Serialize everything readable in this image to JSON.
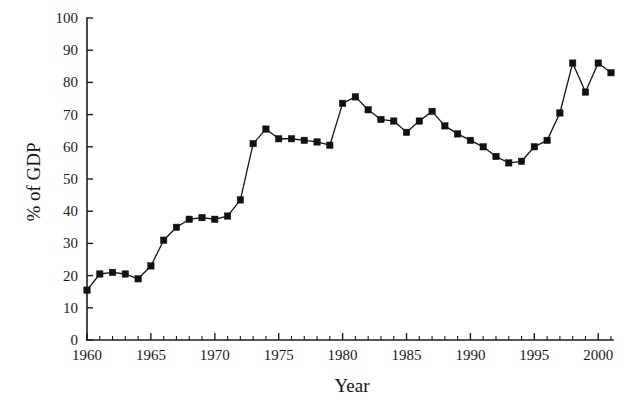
{
  "chart_data": {
    "type": "line",
    "title": "",
    "xlabel": "Year",
    "ylabel": "% of GDP",
    "xlim": [
      1959,
      2002
    ],
    "ylim": [
      0,
      100
    ],
    "grid": false,
    "legend": null,
    "x_major_ticks": [
      1960,
      1965,
      1970,
      1975,
      1980,
      1985,
      1990,
      1995,
      2000
    ],
    "x_tick_labels": [
      "1960",
      "1965",
      "1970",
      "1975",
      "1980",
      "1985",
      "1990",
      "1995",
      "2000"
    ],
    "x_minor_tick_step": 1,
    "y_ticks": [
      0,
      10,
      20,
      30,
      40,
      50,
      60,
      70,
      80,
      90,
      100
    ],
    "y_tick_labels": [
      "0",
      "10",
      "20",
      "30",
      "40",
      "50",
      "60",
      "70",
      "80",
      "90",
      "100"
    ],
    "marker": "square",
    "series": [
      {
        "name": "% of GDP",
        "color": "#141414",
        "x": [
          1960,
          1961,
          1962,
          1963,
          1964,
          1965,
          1966,
          1967,
          1968,
          1969,
          1970,
          1971,
          1972,
          1973,
          1974,
          1975,
          1976,
          1977,
          1978,
          1979,
          1980,
          1981,
          1982,
          1983,
          1984,
          1985,
          1986,
          1987,
          1988,
          1989,
          1990,
          1991,
          1992,
          1993,
          1994,
          1995,
          1996,
          1997,
          1998,
          1999,
          2000,
          2001
        ],
        "values": [
          15.5,
          20.5,
          21.0,
          20.5,
          19.0,
          23.0,
          31.0,
          35.0,
          37.5,
          38.0,
          37.5,
          38.5,
          43.5,
          61.0,
          65.5,
          62.5,
          62.5,
          62.0,
          61.5,
          60.5,
          73.5,
          75.5,
          71.5,
          68.5,
          68.0,
          64.5,
          68.0,
          71.0,
          66.5,
          64.0,
          62.0,
          60.0,
          57.0,
          55.0,
          55.5,
          60.0,
          62.0,
          70.5,
          86.0,
          77.0,
          86.0,
          83.0
        ]
      }
    ]
  },
  "figure": {
    "background_color": "#ffffff",
    "axis_color": "#1c1c1c",
    "marker_color": "#111111"
  }
}
